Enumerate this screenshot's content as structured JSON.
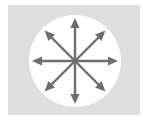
{
  "figure": {
    "canvas": {
      "width": 148,
      "height": 123,
      "page_background": "#ffffff"
    },
    "panel": {
      "name": "light-gray-backdrop-panel",
      "x": 8,
      "y": 5,
      "width": 132,
      "height": 110,
      "fill": "#dedede"
    },
    "circle": {
      "name": "white-circular-field",
      "center_x": 75,
      "center_y": 61,
      "radius": 46,
      "fill": "#ffffff"
    },
    "arrows": {
      "count": 8,
      "stroke_color": "#6e6e6e",
      "stroke_width": 2.4,
      "head_length": 10,
      "head_half_width": 4.6,
      "shaft_length": 43,
      "origin_x": 75,
      "origin_y": 61,
      "items": [
        {
          "label": "N",
          "direction": "up",
          "angle_deg": 270
        },
        {
          "label": "NE",
          "direction": "up-right",
          "angle_deg": 315
        },
        {
          "label": "E",
          "direction": "right",
          "angle_deg": 0
        },
        {
          "label": "SE",
          "direction": "down-right",
          "angle_deg": 45
        },
        {
          "label": "S",
          "direction": "down",
          "angle_deg": 90
        },
        {
          "label": "SW",
          "direction": "down-left",
          "angle_deg": 135
        },
        {
          "label": "W",
          "direction": "left",
          "angle_deg": 180
        },
        {
          "label": "NW",
          "direction": "up-left",
          "angle_deg": 225
        }
      ]
    }
  }
}
